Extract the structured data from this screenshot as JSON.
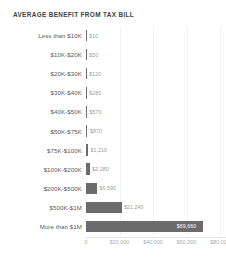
{
  "chart_data": {
    "type": "bar",
    "orientation": "horizontal",
    "title": "AVERAGE BENEFIT FROM TAX BILL",
    "xlabel": "",
    "ylabel": "",
    "xlim": [
      0,
      80000
    ],
    "grid": true,
    "legend": "none",
    "categories": [
      "Less than $10K",
      "$10K-$20K",
      "$20K-$30K",
      "$30K-$40K",
      "$40K-$50K",
      "$50K-$75K",
      "$75K-$100K",
      "$100K-$200K",
      "$200K-$500K",
      "$500K-$1M",
      "More than $1M"
    ],
    "values": [
      10,
      50,
      120,
      280,
      570,
      870,
      1210,
      2280,
      6590,
      21240,
      69660
    ],
    "value_labels": [
      "$10",
      "$50",
      "$120",
      "$280",
      "$570",
      "$870",
      "$1,210",
      "$2,280",
      "$6,590",
      "$21,240",
      "$69,660"
    ],
    "label_inside": [
      false,
      false,
      false,
      false,
      false,
      false,
      false,
      false,
      false,
      false,
      true
    ],
    "xticks": [
      0,
      20000,
      40000,
      60000,
      80000
    ],
    "xtick_labels": [
      "0",
      "$20,000",
      "$40,000",
      "$60,000",
      "$80,000"
    ],
    "bar_color": "#6b6b6b",
    "value_label_color": "#9a9a9a",
    "inside_label_color": "#ffffff",
    "title_color": "#3f3f3f",
    "category_label_color": "#5a5a5a",
    "tick_label_color": "#a8a8a8",
    "gridline_color": "#f2f2f2",
    "background": "#ffffff"
  }
}
